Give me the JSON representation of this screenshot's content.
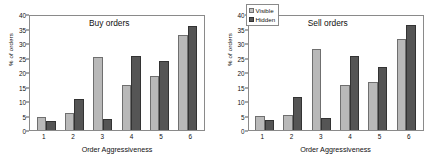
{
  "figure": {
    "panels": [
      {
        "title": "Buy orders",
        "show_legend": false,
        "xlabel": "Order Aggressiveness",
        "ylabel": "% of orders"
      },
      {
        "title": "Sell orders",
        "show_legend": true,
        "xlabel": "Order Aggressiveness",
        "ylabel": "% of orders"
      }
    ],
    "legend": {
      "visible_label": "Visible",
      "hidden_label": "Hidden"
    },
    "colors": {
      "visible": "#b9b9b9",
      "hidden": "#555555",
      "axis": "#8a8a8a",
      "text": "#111111",
      "background": "#ffffff"
    },
    "yticks": [
      "0",
      "5",
      "10",
      "15",
      "20",
      "25",
      "30",
      "35",
      "40"
    ],
    "xticks": [
      "1",
      "2",
      "3",
      "4",
      "5",
      "6"
    ]
  },
  "chart_data": [
    {
      "type": "bar",
      "title": "Buy orders",
      "xlabel": "Order Aggressiveness",
      "ylabel": "% of orders",
      "categories": [
        "1",
        "2",
        "3",
        "4",
        "5",
        "6"
      ],
      "series": [
        {
          "name": "Visible",
          "values": [
            4.5,
            5.7,
            25.3,
            15.5,
            18.5,
            32.7
          ]
        },
        {
          "name": "Hidden",
          "values": [
            3.2,
            10.7,
            3.8,
            25.5,
            23.7,
            35.7
          ]
        }
      ],
      "ylim": [
        0,
        40
      ],
      "ytick_step": 5,
      "grid": false,
      "legend_position": "none"
    },
    {
      "type": "bar",
      "title": "Sell orders",
      "xlabel": "Order Aggressiveness",
      "ylabel": "% of orders",
      "categories": [
        "1",
        "2",
        "3",
        "4",
        "5",
        "6"
      ],
      "series": [
        {
          "name": "Visible",
          "values": [
            5.0,
            5.2,
            28.0,
            15.4,
            16.5,
            31.5
          ]
        },
        {
          "name": "Hidden",
          "values": [
            3.5,
            11.3,
            4.3,
            25.4,
            21.7,
            36.1
          ]
        }
      ],
      "ylim": [
        0,
        40
      ],
      "ytick_step": 5,
      "grid": false,
      "legend_position": "upper-left"
    }
  ]
}
